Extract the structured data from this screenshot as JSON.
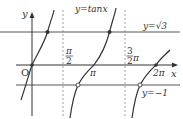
{
  "figure": {
    "title": "y=tanx",
    "function_label": "y=tanx",
    "axis_labels": {
      "x": "x",
      "y": "y",
      "origin": "O"
    },
    "horizontal_lines": [
      {
        "label": "y=√3",
        "value": "√3"
      },
      {
        "label": "y=−1",
        "value": "-1"
      }
    ],
    "asymptotes": [
      {
        "label_num": "π",
        "label_den": "2",
        "value": "π/2"
      },
      {
        "label_num": "3",
        "label_den": "2",
        "label_suffix": "π",
        "value": "3π/2"
      }
    ],
    "x_tick_labels": [
      "π",
      "2π"
    ],
    "points": [
      {
        "desc": "intersection with y=√3 at x=π/3",
        "style": "filled"
      },
      {
        "desc": "intersection with y=√3 at x=4π/3",
        "style": "filled"
      },
      {
        "desc": "intersection with y=−1 at x=3π/4",
        "style": "open"
      },
      {
        "desc": "intersection with y=−1 at x=7π/4",
        "style": "open"
      },
      {
        "desc": "origin",
        "style": "filled"
      },
      {
        "desc": "x=2π on axis",
        "style": "filled"
      }
    ],
    "colors": {
      "axis": "#333333",
      "curve": "#333333",
      "line": "#555555",
      "dash": "#888888"
    }
  }
}
